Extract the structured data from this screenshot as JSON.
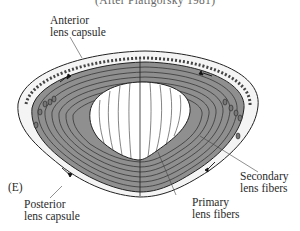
{
  "figure": {
    "top_caption_partial": "(After Piatigorsky 1981)",
    "panel_letter": "(E)",
    "labels": {
      "anterior_capsule": [
        "Anterior",
        "lens capsule"
      ],
      "posterior_capsule": [
        "Posterior",
        "lens capsule"
      ],
      "secondary_fibers": [
        "Secondary",
        "lens fibers"
      ],
      "primary_fibers": [
        "Primary",
        "lens fibers"
      ]
    },
    "colors": {
      "fiber_fill": "#8f8f8f",
      "line": "#222222",
      "capsule_fill": "#f4f4f4",
      "core_fill": "#ffffff"
    }
  }
}
